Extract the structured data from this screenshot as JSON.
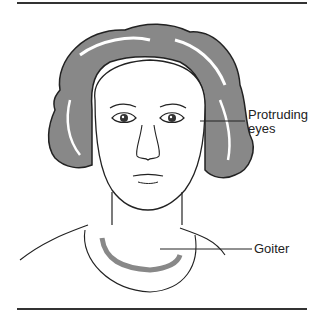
{
  "figure": {
    "labels": [
      {
        "id": "protruding-eyes",
        "text_line1": "Protruding",
        "text_line2": "eyes"
      },
      {
        "id": "goiter",
        "text": "Goiter"
      }
    ],
    "colors": {
      "line": "#222222",
      "shade": "#808080",
      "background": "#ffffff"
    }
  }
}
